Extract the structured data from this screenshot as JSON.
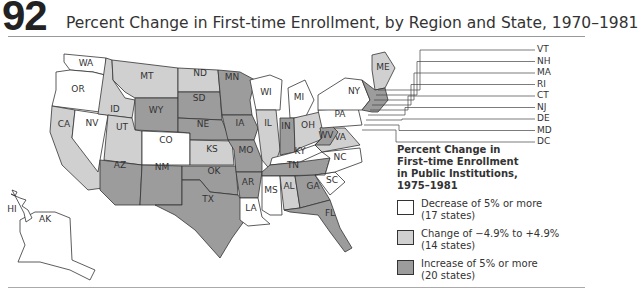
{
  "header": {
    "number": "92",
    "title": "Percent Change in First-time Enrollment, by Region and State, 1970–1981"
  },
  "colors": {
    "decrease": "#ffffff",
    "change": "#d0d0d0",
    "increase": "#9c9c9c",
    "outline": "#333333"
  },
  "legend": {
    "title_lines": [
      "Percent Change in",
      "First–time Enrollment",
      "in Public Institutions,",
      "1975–1981"
    ],
    "items": [
      {
        "label": "Decrease of 5% or more",
        "count": "(17 states)",
        "category": "decrease"
      },
      {
        "label": "Change of −4.9% to +4.9%",
        "count": "(14 states)",
        "category": "change"
      },
      {
        "label": "Increase of 5% or more",
        "count": "(20 states)",
        "category": "increase"
      }
    ]
  },
  "northeast_callouts": [
    "VT",
    "NH",
    "MA",
    "RI",
    "CT",
    "NJ",
    "DE",
    "MD",
    "DC"
  ],
  "chart_data": {
    "type": "choropleth",
    "title": "Percent Change in First-time Enrollment, by Region and State, 1970–1981",
    "legend_title": "Percent Change in First–time Enrollment in Public Institutions, 1975–1981",
    "categories": [
      "Decrease of 5% or more (17 states)",
      "Change of −4.9% to +4.9% (14 states)",
      "Increase of 5% or more (20 states)"
    ],
    "states": {
      "WA": "decrease",
      "OR": "decrease",
      "CA": "change",
      "NV": "decrease",
      "ID": "change",
      "MT": "change",
      "WY": "increase",
      "UT": "change",
      "CO": "decrease",
      "AZ": "increase",
      "NM": "increase",
      "ND": "change",
      "SD": "increase",
      "NE": "increase",
      "KS": "change",
      "OK": "increase",
      "TX": "increase",
      "MN": "increase",
      "IA": "increase",
      "MO": "increase",
      "AR": "increase",
      "LA": "decrease",
      "WI": "decrease",
      "IL": "change",
      "MI": "decrease",
      "IN": "increase",
      "OH": "change",
      "KY": "decrease",
      "TN": "increase",
      "MS": "decrease",
      "AL": "change",
      "GA": "increase",
      "FL": "increase",
      "SC": "decrease",
      "NC": "decrease",
      "VA": "change",
      "WV": "increase",
      "PA": "decrease",
      "NY": "decrease",
      "ME": "change",
      "AK": "decrease",
      "HI": "decrease"
    }
  }
}
